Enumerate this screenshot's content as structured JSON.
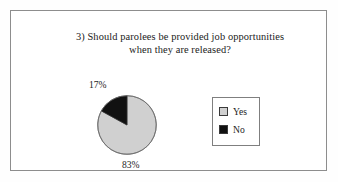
{
  "figure": {
    "background_color": "#ffffff",
    "border_color": "#8d8d8d"
  },
  "chart_data": {
    "type": "pie",
    "title": "3) Should parolees be provided job opportunities when they are released?",
    "title_lines": [
      "3) Should parolees be provided job opportunities",
      "when they are released?"
    ],
    "categories": [
      "Yes",
      "No"
    ],
    "values": [
      83,
      17
    ],
    "value_labels": [
      "83%",
      "17%"
    ],
    "unit": "%",
    "colors": [
      "#d0d0d0",
      "#111111"
    ],
    "legend": {
      "position": "right",
      "entries": [
        {
          "label": "Yes",
          "color": "#d0d0d0",
          "swatch": "light-gray-square"
        },
        {
          "label": "No",
          "color": "#111111",
          "swatch": "black-square"
        }
      ]
    },
    "start_angle_deg": 0,
    "direction": "counterclockwise",
    "xlabel": "",
    "ylabel": "",
    "grid": false
  }
}
